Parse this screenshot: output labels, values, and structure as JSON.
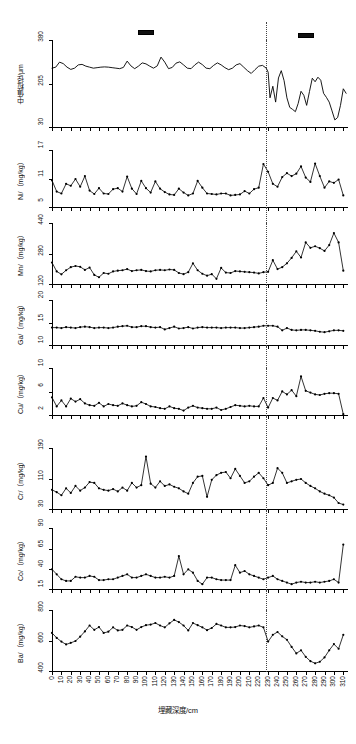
{
  "figure": {
    "xaxis_title": "埋藏深度/cm",
    "x_ticks": [
      0,
      10,
      20,
      30,
      40,
      50,
      60,
      70,
      80,
      90,
      100,
      110,
      120,
      130,
      140,
      150,
      160,
      170,
      180,
      190,
      200,
      210,
      220,
      230,
      240,
      250,
      260,
      270,
      280,
      290,
      300,
      310
    ],
    "x_range": [
      0,
      315
    ],
    "boundary_depth": 228,
    "legend": [
      {
        "name": "legend-bar-left",
        "x_center_cm": 100
      },
      {
        "name": "legend-bar-right",
        "x_center_cm": 270
      }
    ]
  },
  "chart_data": [
    {
      "type": "line",
      "title": "",
      "ylabel": "中值粒径/μm",
      "xlabel": "埋藏深度/cm",
      "ylim": [
        30,
        380
      ],
      "yticks": [
        30,
        205,
        380
      ],
      "markers": false,
      "grid": false,
      "x": [
        0,
        4,
        8,
        12,
        16,
        20,
        24,
        28,
        32,
        36,
        40,
        44,
        48,
        52,
        56,
        60,
        64,
        68,
        72,
        76,
        80,
        84,
        88,
        92,
        96,
        100,
        104,
        108,
        112,
        116,
        120,
        124,
        128,
        132,
        136,
        140,
        144,
        148,
        152,
        156,
        160,
        164,
        168,
        172,
        176,
        180,
        184,
        188,
        192,
        196,
        200,
        204,
        208,
        212,
        216,
        220,
        224,
        228,
        230,
        232,
        235,
        238,
        241,
        244,
        247,
        250,
        253,
        256,
        259,
        262,
        265,
        268,
        271,
        274,
        277,
        280,
        283,
        286,
        289,
        292,
        295,
        298,
        301,
        304,
        307,
        310,
        313
      ],
      "values": [
        268,
        272,
        292,
        286,
        272,
        263,
        268,
        281,
        283,
        276,
        272,
        268,
        270,
        272,
        273,
        272,
        270,
        268,
        266,
        271,
        296,
        277,
        266,
        276,
        289,
        285,
        276,
        268,
        277,
        312,
        292,
        266,
        271,
        288,
        293,
        281,
        268,
        266,
        281,
        292,
        282,
        268,
        266,
        279,
        289,
        281,
        270,
        262,
        268,
        281,
        286,
        272,
        258,
        247,
        262,
        276,
        279,
        268,
        252,
        150,
        196,
        133,
        229,
        258,
        218,
        150,
        112,
        104,
        95,
        128,
        176,
        160,
        120,
        175,
        228,
        214,
        232,
        220,
        168,
        152,
        133,
        98,
        62,
        72,
        120,
        186,
        168
      ]
    },
    {
      "type": "line",
      "ylabel": "Ni/（mg/kg）",
      "xlabel": "埋藏深度/cm",
      "ylim": [
        5,
        17
      ],
      "yticks": [
        5,
        11,
        17
      ],
      "markers": true,
      "grid": false,
      "x": [
        0,
        5,
        10,
        15,
        20,
        25,
        30,
        35,
        40,
        45,
        50,
        55,
        60,
        65,
        70,
        75,
        80,
        85,
        90,
        95,
        100,
        105,
        110,
        115,
        120,
        125,
        130,
        135,
        140,
        145,
        150,
        155,
        160,
        165,
        170,
        175,
        180,
        185,
        190,
        195,
        200,
        205,
        210,
        215,
        220,
        225,
        230,
        235,
        240,
        245,
        250,
        255,
        260,
        265,
        270,
        275,
        280,
        285,
        290,
        295,
        300,
        305,
        310
      ],
      "values": [
        10.7,
        8.4,
        8.0,
        10.0,
        9.6,
        11.0,
        9.4,
        11.6,
        8.6,
        7.9,
        9.1,
        8.0,
        7.9,
        8.9,
        9.1,
        8.4,
        11.5,
        9.0,
        7.9,
        10.6,
        9.1,
        8.2,
        10.5,
        9.0,
        8.3,
        7.8,
        7.7,
        9.0,
        8.2,
        7.6,
        8.0,
        10.6,
        9.2,
        8.0,
        7.9,
        7.8,
        8.0,
        8.0,
        7.6,
        7.7,
        7.8,
        8.5,
        8.0,
        8.9,
        9.2,
        14.1,
        12.5,
        10.0,
        9.4,
        11.4,
        12.2,
        11.6,
        12.1,
        13.6,
        11.3,
        10.4,
        14.2,
        11.6,
        9.2,
        10.5,
        10.2,
        10.9,
        7.6
      ]
    },
    {
      "type": "line",
      "ylabel": "Mn/（mg/kg）",
      "xlabel": "埋藏深度/cm",
      "ylim": [
        120,
        440
      ],
      "yticks": [
        120,
        280,
        440
      ],
      "markers": true,
      "grid": false,
      "x": [
        0,
        5,
        10,
        15,
        20,
        25,
        30,
        35,
        40,
        45,
        50,
        55,
        60,
        65,
        70,
        75,
        80,
        85,
        90,
        95,
        100,
        105,
        110,
        115,
        120,
        125,
        130,
        135,
        140,
        145,
        150,
        155,
        160,
        165,
        170,
        175,
        180,
        185,
        190,
        195,
        200,
        205,
        210,
        215,
        220,
        225,
        230,
        235,
        240,
        245,
        250,
        255,
        260,
        265,
        270,
        275,
        280,
        285,
        290,
        295,
        300,
        305,
        310
      ],
      "values": [
        236,
        190,
        175,
        196,
        212,
        218,
        214,
        198,
        210,
        172,
        160,
        182,
        178,
        190,
        194,
        196,
        202,
        192,
        196,
        198,
        192,
        190,
        196,
        198,
        196,
        200,
        198,
        182,
        176,
        186,
        232,
        196,
        178,
        168,
        176,
        152,
        208,
        184,
        182,
        192,
        190,
        188,
        186,
        184,
        180,
        186,
        188,
        248,
        202,
        212,
        232,
        260,
        294,
        262,
        340,
        312,
        320,
        310,
        296,
        326,
        388,
        340,
        194
      ]
    },
    {
      "type": "line",
      "ylabel": "Ga/（mg/kg）",
      "xlabel": "埋藏深度/cm",
      "ylim": [
        10,
        20
      ],
      "yticks": [
        10,
        15,
        20
      ],
      "markers": true,
      "grid": false,
      "x": [
        0,
        5,
        10,
        15,
        20,
        25,
        30,
        35,
        40,
        45,
        50,
        55,
        60,
        65,
        70,
        75,
        80,
        85,
        90,
        95,
        100,
        105,
        110,
        115,
        120,
        125,
        130,
        135,
        140,
        145,
        150,
        155,
        160,
        165,
        170,
        175,
        180,
        185,
        190,
        195,
        200,
        205,
        210,
        215,
        220,
        225,
        230,
        235,
        240,
        245,
        250,
        255,
        260,
        265,
        270,
        275,
        280,
        285,
        290,
        295,
        300,
        305,
        310
      ],
      "values": [
        14.0,
        14.0,
        13.9,
        14.1,
        14.0,
        13.9,
        14.1,
        14.2,
        14.1,
        13.9,
        14.0,
        14.0,
        13.9,
        14.0,
        14.2,
        14.3,
        14.4,
        14.1,
        14.1,
        14.3,
        14.3,
        14.1,
        14.0,
        14.1,
        13.6,
        13.9,
        14.2,
        13.8,
        13.9,
        14.1,
        13.8,
        14.0,
        14.1,
        14.0,
        14.0,
        14.0,
        13.9,
        14.0,
        14.0,
        14.0,
        13.9,
        13.9,
        14.0,
        14.1,
        14.2,
        14.4,
        14.4,
        14.4,
        14.2,
        13.4,
        13.9,
        13.5,
        13.4,
        13.5,
        13.5,
        13.4,
        13.3,
        13.1,
        13.0,
        13.2,
        13.4,
        13.4,
        13.3
      ]
    },
    {
      "type": "line",
      "ylabel": "Cu/（mg/kg）",
      "xlabel": "埋藏深度/cm",
      "ylim": [
        2,
        10
      ],
      "yticks": [
        2,
        6,
        10
      ],
      "markers": true,
      "grid": false,
      "x": [
        0,
        5,
        10,
        15,
        20,
        25,
        30,
        35,
        40,
        45,
        50,
        55,
        60,
        65,
        70,
        75,
        80,
        85,
        90,
        95,
        100,
        105,
        110,
        115,
        120,
        125,
        130,
        135,
        140,
        145,
        150,
        155,
        160,
        165,
        170,
        175,
        180,
        185,
        190,
        195,
        200,
        205,
        210,
        215,
        220,
        225,
        230,
        235,
        240,
        245,
        250,
        255,
        260,
        265,
        270,
        275,
        280,
        285,
        290,
        295,
        300,
        305,
        310
      ],
      "values": [
        5.1,
        3.6,
        4.6,
        3.6,
        4.9,
        4.4,
        4.8,
        4.1,
        3.8,
        3.7,
        4.2,
        3.6,
        4.0,
        3.8,
        3.7,
        4.1,
        3.8,
        3.6,
        3.7,
        4.3,
        4.0,
        3.6,
        3.5,
        3.3,
        3.2,
        3.6,
        3.3,
        3.2,
        2.9,
        3.4,
        3.7,
        3.4,
        3.3,
        3.2,
        3.2,
        3.4,
        3.0,
        3.2,
        3.5,
        3.8,
        3.7,
        3.6,
        3.7,
        3.6,
        3.6,
        5.0,
        3.4,
        5.0,
        4.6,
        6.1,
        5.6,
        6.3,
        5.3,
        8.6,
        6.2,
        5.9,
        5.6,
        5.5,
        5.7,
        5.8,
        5.8,
        5.7,
        2.3
      ]
    },
    {
      "type": "line",
      "ylabel": "Cr/（mg/kg）",
      "xlabel": "埋藏深度/cm",
      "ylim": [
        30,
        190
      ],
      "yticks": [
        30,
        110,
        190
      ],
      "markers": true,
      "grid": false,
      "x": [
        0,
        5,
        10,
        15,
        20,
        25,
        30,
        35,
        40,
        45,
        50,
        55,
        60,
        65,
        70,
        75,
        80,
        85,
        90,
        95,
        100,
        105,
        110,
        115,
        120,
        125,
        130,
        135,
        140,
        145,
        150,
        155,
        160,
        165,
        170,
        175,
        180,
        185,
        190,
        195,
        200,
        205,
        210,
        215,
        220,
        225,
        230,
        235,
        240,
        245,
        250,
        255,
        260,
        265,
        270,
        275,
        280,
        285,
        290,
        295,
        300,
        305,
        310
      ],
      "values": [
        82,
        76,
        68,
        86,
        74,
        92,
        80,
        88,
        102,
        100,
        86,
        82,
        80,
        84,
        78,
        88,
        80,
        100,
        88,
        94,
        168,
        98,
        88,
        104,
        92,
        96,
        90,
        86,
        78,
        72,
        100,
        116,
        118,
        64,
        108,
        120,
        126,
        128,
        112,
        136,
        118,
        100,
        104,
        116,
        126,
        112,
        94,
        100,
        138,
        126,
        100,
        104,
        108,
        110,
        100,
        92,
        86,
        78,
        72,
        68,
        62,
        48,
        44
      ]
    },
    {
      "type": "line",
      "ylabel": "Co/（mg/kg）",
      "xlabel": "埋藏深度/cm",
      "ylim": [
        15,
        90
      ],
      "yticks": [
        15,
        40,
        65,
        90
      ],
      "markers": true,
      "grid": false,
      "x": [
        0,
        5,
        10,
        15,
        20,
        25,
        30,
        35,
        40,
        45,
        50,
        55,
        60,
        65,
        70,
        75,
        80,
        85,
        90,
        95,
        100,
        105,
        110,
        115,
        120,
        125,
        130,
        135,
        140,
        145,
        150,
        155,
        160,
        165,
        170,
        175,
        180,
        185,
        190,
        195,
        200,
        205,
        210,
        215,
        220,
        225,
        230,
        235,
        240,
        245,
        250,
        255,
        260,
        265,
        270,
        275,
        280,
        285,
        290,
        295,
        300,
        305,
        310
      ],
      "values": [
        40,
        34,
        28,
        26,
        26,
        31,
        30,
        30,
        32,
        31,
        27,
        27,
        28,
        28,
        30,
        32,
        34,
        30,
        30,
        32,
        34,
        32,
        30,
        30,
        31,
        30,
        32,
        56,
        34,
        40,
        36,
        26,
        22,
        30,
        30,
        28,
        27,
        27,
        27,
        45,
        36,
        38,
        34,
        32,
        30,
        28,
        30,
        32,
        28,
        26,
        24,
        22,
        24,
        25,
        24,
        24,
        25,
        24,
        25,
        26,
        28,
        24,
        70
      ]
    },
    {
      "type": "line",
      "ylabel": "Ba/（mg/kg）",
      "xlabel": "埋藏深度/cm",
      "ylim": [
        400,
        800
      ],
      "yticks": [
        400,
        600,
        800
      ],
      "markers": true,
      "grid": false,
      "x": [
        0,
        5,
        10,
        15,
        20,
        25,
        30,
        35,
        40,
        45,
        50,
        55,
        60,
        65,
        70,
        75,
        80,
        85,
        90,
        95,
        100,
        105,
        110,
        115,
        120,
        125,
        130,
        135,
        140,
        145,
        150,
        155,
        160,
        165,
        170,
        175,
        180,
        185,
        190,
        195,
        200,
        205,
        210,
        215,
        220,
        225,
        230,
        235,
        240,
        245,
        250,
        255,
        260,
        265,
        270,
        275,
        280,
        285,
        290,
        295,
        300,
        305,
        310
      ],
      "values": [
        652,
        620,
        596,
        578,
        588,
        600,
        628,
        662,
        700,
        672,
        690,
        652,
        660,
        688,
        668,
        672,
        700,
        690,
        672,
        690,
        702,
        706,
        716,
        700,
        688,
        714,
        736,
        722,
        700,
        668,
        716,
        702,
        688,
        670,
        684,
        710,
        700,
        688,
        688,
        690,
        700,
        696,
        688,
        694,
        700,
        688,
        596,
        640,
        658,
        630,
        608,
        562,
        520,
        540,
        498,
        470,
        456,
        466,
        494,
        540,
        580,
        550,
        640
      ]
    }
  ]
}
